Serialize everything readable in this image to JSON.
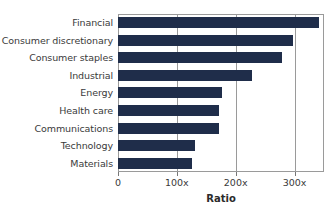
{
  "chart_data": {
    "type": "bar",
    "orientation": "horizontal",
    "title": "",
    "xlabel": "Ratio",
    "ylabel": "",
    "categories": [
      "Financial",
      "Consumer discretionary",
      "Consumer staples",
      "Industrial",
      "Energy",
      "Health care",
      "Communications",
      "Technology",
      "Materials"
    ],
    "values": [
      342,
      297,
      278,
      227,
      177,
      172,
      172,
      130,
      125
    ],
    "xlim": [
      0,
      350
    ],
    "xticks": [
      0,
      100,
      200,
      300
    ],
    "xticklabels": [
      "0",
      "100x",
      "200x",
      "300x"
    ],
    "grid": true,
    "grid_axis": "x",
    "legend": false,
    "bar_color": "#1f2d4a",
    "frame_color": "#9a9a9a"
  }
}
